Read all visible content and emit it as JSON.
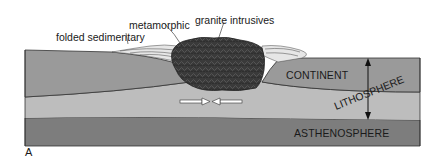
{
  "figure": {
    "panel_label": "A",
    "labels": {
      "folded_sedimentary": "folded sedimentary",
      "metamorphic": "metamorphic",
      "granite_intrusives": "granite intrusives",
      "continent": "CONTINENT",
      "lithosphere": "LITHOSPHERE",
      "asthenosphere": "ASTHENOSPHERE"
    },
    "colors": {
      "continent": "#9a9a9a",
      "lithosphere_lower": "#bdbdbd",
      "asthenosphere": "#7d7d7d",
      "granite": "#3a3a3a",
      "outline": "#333333",
      "sediment_light": "#e6e6e6"
    },
    "annotations": {
      "compression_arrows": "converging horizontal arrows beneath mountain root",
      "thickness_arrow": "double-headed vertical arrow spanning lithosphere"
    }
  }
}
